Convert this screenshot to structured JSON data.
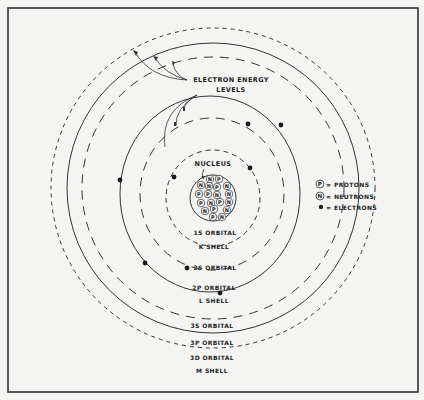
{
  "diagram": {
    "title_annotation": {
      "line1": "ELECTRON ENERGY",
      "line2": "LEVELS"
    },
    "nucleus_label": "NUCLEUS",
    "nucleus_particles": [
      {
        "sym": "N",
        "x": 210,
        "y": 179
      },
      {
        "sym": "P",
        "x": 219,
        "y": 179
      },
      {
        "sym": "N",
        "x": 201,
        "y": 185
      },
      {
        "sym": "N",
        "x": 209,
        "y": 186
      },
      {
        "sym": "P",
        "x": 217,
        "y": 187
      },
      {
        "sym": "N",
        "x": 227,
        "y": 186
      },
      {
        "sym": "P",
        "x": 199,
        "y": 194
      },
      {
        "sym": "P",
        "x": 208,
        "y": 194
      },
      {
        "sym": "N",
        "x": 217,
        "y": 195
      },
      {
        "sym": "N",
        "x": 229,
        "y": 194
      },
      {
        "sym": "P",
        "x": 201,
        "y": 203
      },
      {
        "sym": "N",
        "x": 211,
        "y": 203
      },
      {
        "sym": "P",
        "x": 220,
        "y": 202
      },
      {
        "sym": "N",
        "x": 229,
        "y": 202
      },
      {
        "sym": "N",
        "x": 205,
        "y": 211
      },
      {
        "sym": "P",
        "x": 214,
        "y": 209
      },
      {
        "sym": "N",
        "x": 227,
        "y": 210
      },
      {
        "sym": "P",
        "x": 213,
        "y": 217
      },
      {
        "sym": "N",
        "x": 222,
        "y": 217
      }
    ],
    "orbital_labels": {
      "s1": "1S ORBITAL",
      "k_shell": "K SHELL",
      "s2": "2S ORBITAL",
      "p2": "2P ORBITAL",
      "l_shell": "L SHELL",
      "s3": "3S ORBITAL",
      "p3": "3P ORBITAL",
      "d3": "3D ORBITAL",
      "m_shell": "M SHELL"
    },
    "legend": {
      "protons_symbol": "P",
      "protons_label": "= PROTONS",
      "neutrons_symbol": "N",
      "neutrons_label": "= NEUTRONS",
      "electrons_label": "= ELECTRONS"
    },
    "electrons": [
      {
        "x": 174,
        "y": 177
      },
      {
        "x": 250,
        "y": 168
      },
      {
        "x": 248,
        "y": 124
      },
      {
        "x": 281,
        "y": 125
      },
      {
        "x": 120,
        "y": 180
      },
      {
        "x": 145,
        "y": 263
      },
      {
        "x": 187,
        "y": 268
      },
      {
        "x": 220,
        "y": 293
      }
    ],
    "colors": {
      "ink": "#222222",
      "paper": "#f4f4f2",
      "frame": "#333333"
    }
  }
}
